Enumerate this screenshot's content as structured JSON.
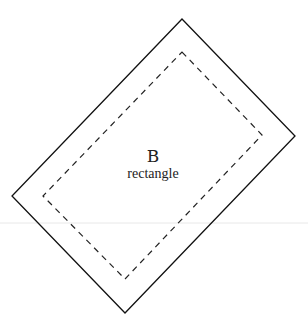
{
  "diagram": {
    "shape_letter": "B",
    "shape_name": "rectangle",
    "outer_rect": {
      "points": [
        [
          182,
          19
        ],
        [
          295,
          136
        ],
        [
          125,
          313
        ],
        [
          12,
          196
        ]
      ],
      "stroke": "#111111",
      "style": "solid"
    },
    "inner_rect": {
      "points": [
        [
          182,
          52
        ],
        [
          262,
          135
        ],
        [
          125,
          279
        ],
        [
          43,
          196
        ]
      ],
      "stroke": "#222222",
      "style": "dashed"
    },
    "divider_line": {
      "y": 223,
      "color": "#e6e6e6"
    }
  }
}
